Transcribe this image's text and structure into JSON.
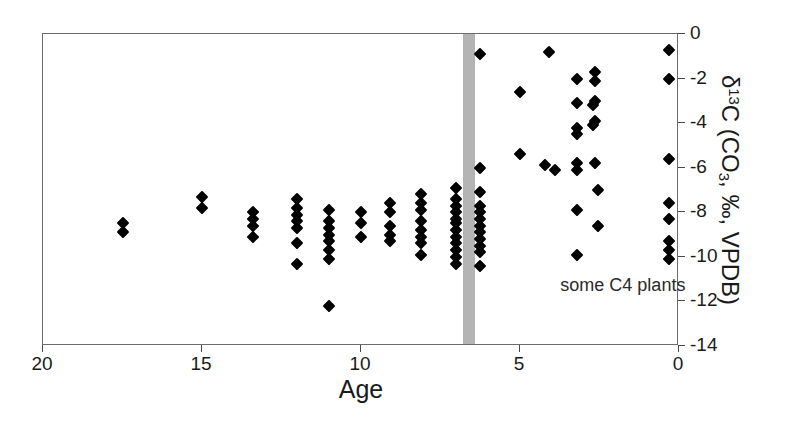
{
  "chart_data": {
    "type": "scatter",
    "title": "",
    "xlabel": "Age",
    "ylabel": "δ13C (CO3, ‰, VPDB)",
    "ylabel_parts": {
      "prefix": "δ",
      "sup": "13",
      "mid": "C (CO",
      "sub": "3",
      "suffix": ", ‰, VPDB)"
    },
    "xlim": [
      20,
      0
    ],
    "ylim": [
      -14,
      0
    ],
    "x_reversed": true,
    "grid": false,
    "legend": null,
    "xticks": [
      20,
      15,
      10,
      5,
      0
    ],
    "xtick_labels": [
      "20",
      "15",
      "10",
      "5",
      "0"
    ],
    "yticks": [
      0,
      -2,
      -4,
      -6,
      -8,
      -10,
      -12,
      -14
    ],
    "ytick_labels": [
      "0",
      "-2",
      "-4",
      "-6",
      "-8",
      "-10",
      "-12",
      "-14"
    ],
    "y_axis_position": "right",
    "annotations": [
      {
        "text": "some C4 plants",
        "x": 3.7,
        "y": -11.3
      }
    ],
    "bands": [
      {
        "orientation": "vertical",
        "x_center": 6.62,
        "x_start": 6.8,
        "x_end": 6.42,
        "color": "#b4b4b4"
      }
    ],
    "marker": {
      "shape": "diamond",
      "color": "#000000",
      "size": 9
    },
    "points": [
      {
        "x": 17.5,
        "y": -8.5
      },
      {
        "x": 17.5,
        "y": -8.9
      },
      {
        "x": 15.0,
        "y": -7.3
      },
      {
        "x": 15.0,
        "y": -7.8
      },
      {
        "x": 13.4,
        "y": -8.0
      },
      {
        "x": 13.4,
        "y": -8.3
      },
      {
        "x": 13.4,
        "y": -8.6
      },
      {
        "x": 13.4,
        "y": -9.1
      },
      {
        "x": 12.0,
        "y": -7.4
      },
      {
        "x": 12.0,
        "y": -7.8
      },
      {
        "x": 12.0,
        "y": -8.1
      },
      {
        "x": 12.0,
        "y": -8.4
      },
      {
        "x": 12.0,
        "y": -8.7
      },
      {
        "x": 12.0,
        "y": -9.4
      },
      {
        "x": 12.0,
        "y": -10.3
      },
      {
        "x": 10.0,
        "y": -8.0
      },
      {
        "x": 10.0,
        "y": -8.5
      },
      {
        "x": 10.0,
        "y": -9.1
      },
      {
        "x": 11.0,
        "y": -7.9
      },
      {
        "x": 11.0,
        "y": -8.4
      },
      {
        "x": 11.0,
        "y": -8.7
      },
      {
        "x": 11.0,
        "y": -9.0
      },
      {
        "x": 11.0,
        "y": -9.3
      },
      {
        "x": 11.0,
        "y": -9.7
      },
      {
        "x": 11.0,
        "y": -10.1
      },
      {
        "x": 11.0,
        "y": -12.2
      },
      {
        "x": 9.1,
        "y": -7.6
      },
      {
        "x": 9.1,
        "y": -8.0
      },
      {
        "x": 9.1,
        "y": -8.6
      },
      {
        "x": 9.1,
        "y": -9.0
      },
      {
        "x": 9.1,
        "y": -9.3
      },
      {
        "x": 8.1,
        "y": -7.2
      },
      {
        "x": 8.1,
        "y": -7.6
      },
      {
        "x": 8.1,
        "y": -7.9
      },
      {
        "x": 8.1,
        "y": -8.4
      },
      {
        "x": 8.1,
        "y": -8.8
      },
      {
        "x": 8.1,
        "y": -9.1
      },
      {
        "x": 8.1,
        "y": -9.4
      },
      {
        "x": 8.1,
        "y": -9.9
      },
      {
        "x": 7.0,
        "y": -6.9
      },
      {
        "x": 7.0,
        "y": -7.4
      },
      {
        "x": 7.0,
        "y": -7.7
      },
      {
        "x": 7.0,
        "y": -8.0
      },
      {
        "x": 7.0,
        "y": -8.3
      },
      {
        "x": 7.0,
        "y": -8.5
      },
      {
        "x": 7.0,
        "y": -8.8
      },
      {
        "x": 7.0,
        "y": -9.1
      },
      {
        "x": 7.0,
        "y": -9.4
      },
      {
        "x": 7.0,
        "y": -9.7
      },
      {
        "x": 7.0,
        "y": -10.0
      },
      {
        "x": 7.0,
        "y": -10.3
      },
      {
        "x": 6.25,
        "y": -0.9
      },
      {
        "x": 6.25,
        "y": -6.0
      },
      {
        "x": 6.25,
        "y": -7.1
      },
      {
        "x": 6.25,
        "y": -7.7
      },
      {
        "x": 6.25,
        "y": -8.0
      },
      {
        "x": 6.25,
        "y": -8.3
      },
      {
        "x": 6.25,
        "y": -8.6
      },
      {
        "x": 6.25,
        "y": -8.9
      },
      {
        "x": 6.25,
        "y": -9.2
      },
      {
        "x": 6.25,
        "y": -9.5
      },
      {
        "x": 6.25,
        "y": -9.8
      },
      {
        "x": 6.25,
        "y": -10.4
      },
      {
        "x": 4.1,
        "y": -0.8
      },
      {
        "x": 5.0,
        "y": -2.6
      },
      {
        "x": 5.0,
        "y": -5.4
      },
      {
        "x": 4.2,
        "y": -5.9
      },
      {
        "x": 3.9,
        "y": -6.1
      },
      {
        "x": 3.2,
        "y": -2.0
      },
      {
        "x": 3.2,
        "y": -3.1
      },
      {
        "x": 3.2,
        "y": -4.2
      },
      {
        "x": 3.2,
        "y": -4.5
      },
      {
        "x": 3.2,
        "y": -5.8
      },
      {
        "x": 3.2,
        "y": -6.1
      },
      {
        "x": 3.2,
        "y": -7.9
      },
      {
        "x": 3.2,
        "y": -9.9
      },
      {
        "x": 2.65,
        "y": -1.7
      },
      {
        "x": 2.65,
        "y": -2.1
      },
      {
        "x": 2.65,
        "y": -3.0
      },
      {
        "x": 2.72,
        "y": -3.2
      },
      {
        "x": 2.65,
        "y": -3.9
      },
      {
        "x": 2.72,
        "y": -4.1
      },
      {
        "x": 2.65,
        "y": -5.8
      },
      {
        "x": 2.55,
        "y": -7.0
      },
      {
        "x": 2.55,
        "y": -8.6
      },
      {
        "x": 0.3,
        "y": -0.7
      },
      {
        "x": 0.3,
        "y": -2.0
      },
      {
        "x": 0.3,
        "y": -5.6
      },
      {
        "x": 0.3,
        "y": -7.6
      },
      {
        "x": 0.3,
        "y": -8.3
      },
      {
        "x": 0.3,
        "y": -9.3
      },
      {
        "x": 0.3,
        "y": -9.7
      },
      {
        "x": 0.3,
        "y": -10.1
      }
    ]
  },
  "colors": {
    "marker": "#000000",
    "band": "#b4b4b4",
    "axis": "#6b6b6b",
    "text": "#1a1a1a",
    "background": "#ffffff"
  }
}
